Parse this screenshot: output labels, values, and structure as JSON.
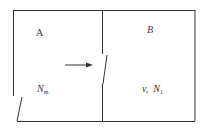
{
  "diagram": {
    "chambers": [
      {
        "id": "A",
        "label": "A",
        "quantity_symbol": "N",
        "quantity_sub": "m"
      },
      {
        "id": "B",
        "label": "B",
        "extra_symbol": "v,",
        "quantity_symbol": "N",
        "quantity_sub": "1"
      }
    ],
    "arrow": {
      "direction": "right",
      "meaning": "flow from A to B through opening"
    },
    "stroke_color": "#333333"
  }
}
